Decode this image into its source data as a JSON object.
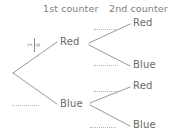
{
  "diagram": {
    "type": "probability-tree",
    "headers": [
      {
        "label": "1st counter"
      },
      {
        "label": "2nd counter"
      }
    ],
    "root": {
      "label": ""
    },
    "level1": [
      {
        "label": "Red",
        "probability": "3/6"
      },
      {
        "label": "Blue",
        "probability": ""
      }
    ],
    "level2": [
      {
        "parent": "Red",
        "label": "Red",
        "probability": ""
      },
      {
        "parent": "Red",
        "label": "Blue",
        "probability": ""
      },
      {
        "parent": "Blue",
        "label": "Red",
        "probability": ""
      },
      {
        "parent": "Blue",
        "label": "Blue",
        "probability": ""
      }
    ],
    "fraction_root_red": {
      "numerator": "3",
      "denominator": "6"
    },
    "blank_labels": [
      {
        "name": "root-blue-probability"
      },
      {
        "name": "red-red-probability"
      },
      {
        "name": "red-blue-probability"
      },
      {
        "name": "blue-red-probability"
      },
      {
        "name": "blue-blue-probability"
      }
    ],
    "colors": {
      "ink": "#7a7a7a",
      "line": "#8c8c8c",
      "dotted": "#b5b5b5",
      "background": "#ffffff"
    }
  }
}
